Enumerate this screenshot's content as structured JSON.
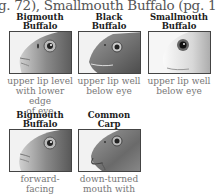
{
  "header": {
    "text": "g. 72), Smallmouth Buffalo (pg. 146)"
  },
  "fish": [
    {
      "name_line1": "Bigmouth",
      "name_line2": "Buffalo",
      "caption_line1": "upper lip level",
      "caption_line2": "with lower edge",
      "caption_line3": "of eye",
      "icon": "bigmouth-buffalo-head-illustration"
    },
    {
      "name_line1": "Black",
      "name_line2": "Buffalo",
      "caption_line1": "upper lip well",
      "caption_line2": "below eye",
      "caption_line3": "",
      "icon": "black-buffalo-head-illustration"
    },
    {
      "name_line1": "Smallmouth",
      "name_line2": "Buffalo",
      "caption_line1": "upper lip well",
      "caption_line2": "below eye",
      "caption_line3": "",
      "icon": "smallmouth-buffalo-head-illustration"
    },
    {
      "name_line1": "Bigmouth",
      "name_line2": "Buffalo",
      "caption_line1": "forward-facing",
      "caption_line2": "mouth, lacks",
      "caption_line3": "",
      "icon": "bigmouth-buffalo-head-illustration"
    },
    {
      "name_line1": "Common",
      "name_line2": "Carp",
      "caption_line1": "down-turned",
      "caption_line2": "mouth with",
      "caption_line3": "",
      "icon": "common-carp-head-illustration"
    }
  ]
}
